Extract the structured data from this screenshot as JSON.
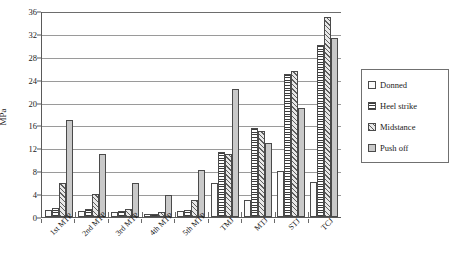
{
  "chart_data": {
    "type": "bar",
    "title": "",
    "xlabel": "",
    "ylabel": "MPa",
    "ylim": [
      0,
      36
    ],
    "yticks": [
      0,
      4,
      8,
      12,
      16,
      20,
      24,
      28,
      32,
      36
    ],
    "grid": true,
    "legend_position": "right",
    "categories": [
      "1st MTP",
      "2nd MTP",
      "3rd MTP",
      "4th MTP",
      "5th MTP",
      "TMJ",
      "MTJ",
      "STJ",
      "TCJ"
    ],
    "series": [
      {
        "name": "Donned",
        "values": [
          1.2,
          1.0,
          0.8,
          0.5,
          1.0,
          6.0,
          3.0,
          8.0,
          6.2
        ]
      },
      {
        "name": "Heel strike",
        "values": [
          1.5,
          1.4,
          1.1,
          0.6,
          1.3,
          11.3,
          15.5,
          25.0,
          30.0
        ]
      },
      {
        "name": "Midstance",
        "values": [
          6.0,
          4.0,
          1.4,
          0.8,
          3.0,
          11.0,
          15.0,
          25.5,
          35.0
        ]
      },
      {
        "name": "Push off",
        "values": [
          17.0,
          11.0,
          6.0,
          3.8,
          8.2,
          22.3,
          13.0,
          19.0,
          31.2
        ]
      }
    ]
  },
  "legend": {
    "items": [
      {
        "label": "Donned",
        "pattern": "outline"
      },
      {
        "label": "Heel strike",
        "pattern": "horizontal-stripes"
      },
      {
        "label": "Midstance",
        "pattern": "diagonal-hatch"
      },
      {
        "label": "Push off",
        "pattern": "solid-gray"
      }
    ]
  }
}
